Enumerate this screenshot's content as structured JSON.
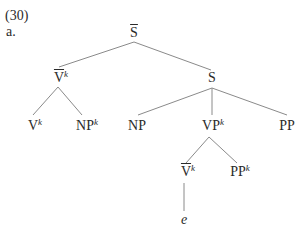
{
  "example": {
    "number": "(30)",
    "sub_label": "a."
  },
  "tree": {
    "root": {
      "base": "S",
      "bar": true,
      "sup": ""
    },
    "vbar_k": {
      "base": "V",
      "bar": true,
      "sup": "k"
    },
    "s": {
      "base": "S",
      "bar": false,
      "sup": ""
    },
    "v_k": {
      "base": "V",
      "bar": false,
      "sup": "k"
    },
    "np_k": {
      "base": "NP",
      "bar": false,
      "sup": "k"
    },
    "np": {
      "base": "NP",
      "bar": false,
      "sup": ""
    },
    "vp_k": {
      "base": "VP",
      "bar": false,
      "sup": "k"
    },
    "pp": {
      "base": "PP",
      "bar": false,
      "sup": ""
    },
    "vbar_k2": {
      "base": "V",
      "bar": true,
      "sup": "k"
    },
    "pp_k": {
      "base": "PP",
      "bar": false,
      "sup": "k"
    },
    "empty": {
      "base": "e"
    }
  },
  "colors": {
    "text": "#2a2a2a",
    "edge": "#8a8a8a"
  }
}
